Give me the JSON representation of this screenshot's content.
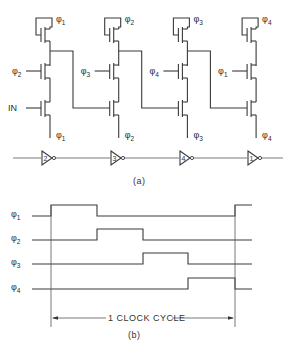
{
  "figure": {
    "part_a": {
      "caption": "(a)",
      "stages": [
        {
          "precharge_clock": "1",
          "gate_clock": "2",
          "input": "IN",
          "source_clock": "1",
          "x": 0
        },
        {
          "precharge_clock": "2",
          "gate_clock": "3",
          "input": "",
          "source_clock": "2",
          "x": 68.7
        },
        {
          "precharge_clock": "3",
          "gate_clock": "4",
          "input": "",
          "source_clock": "3",
          "x": 137.4
        },
        {
          "precharge_clock": "4",
          "gate_clock": "1",
          "input": "",
          "source_clock": "4",
          "x": 206.1
        }
      ],
      "inverter_chain": {
        "labels": [
          "2",
          "3",
          "4",
          "1"
        ],
        "x": [
          42,
          111,
          180,
          248
        ]
      }
    },
    "part_b": {
      "caption": "(b)",
      "cycle_label": "1 CLOCK CYCLE",
      "phase_symbol": "φ",
      "clocks": [
        {
          "name": "1",
          "pulses": [
            [
              51,
              97
            ],
            [
              235,
              252
            ]
          ]
        },
        {
          "name": "2",
          "pulses": [
            [
              97,
              143
            ]
          ]
        },
        {
          "name": "3",
          "pulses": [
            [
              143,
              188
            ]
          ]
        },
        {
          "name": "4",
          "pulses": [
            [
              188,
              235
            ]
          ]
        }
      ]
    }
  },
  "chart_data": {
    "type": "timing",
    "signals": [
      "φ1",
      "φ2",
      "φ3",
      "φ4"
    ],
    "high_intervals_fraction_of_cycle": {
      "φ1": [
        [
          0,
          0.25
        ]
      ],
      "φ2": [
        [
          0.25,
          0.5
        ]
      ],
      "φ3": [
        [
          0.5,
          0.75
        ]
      ],
      "φ4": [
        [
          0.75,
          1.0
        ]
      ]
    },
    "annotation": "1 CLOCK CYCLE"
  }
}
